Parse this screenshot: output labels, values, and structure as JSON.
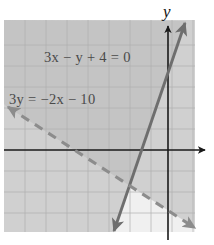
{
  "figure": {
    "kind": "coordinate-plane-inequality-graph",
    "plot_area": {
      "x": 4,
      "y": 20,
      "width": 191,
      "height": 212
    },
    "grid": {
      "spacing_px": 21,
      "color": "#b4b4b4",
      "visible": true
    },
    "background_color": "#f0f0f0",
    "axes": {
      "x_axis": {
        "y_px": 150,
        "arrow": "right",
        "color": "#1a1a1a"
      },
      "y_axis": {
        "x_px": 168,
        "arrow": "up",
        "color": "#1a1a1a"
      },
      "y_axis_label": "y",
      "x_axis_label": ""
    },
    "origin": {
      "x_px": 168,
      "y_px": 150
    },
    "shading": {
      "region_a_color": "#d4d4d4",
      "region_b_color": "#d4d4d4",
      "overlap_color": "#a9a9a9",
      "outside_color": "#f0f0f0"
    },
    "lines": [
      {
        "name": "line-solid",
        "label": "3x − y + 4 = 0",
        "style": "solid",
        "color": "#6e6e6e",
        "arrows": "both",
        "endpoints": {
          "x1": 113,
          "y1": 233,
          "x2": 186,
          "y2": 21
        },
        "label_position": {
          "x": 44,
          "y": 62
        }
      },
      {
        "name": "line-dashed",
        "label": "3y = −2x − 10",
        "style": "dashed",
        "color": "#8c8c8c",
        "arrows": "both",
        "endpoints": {
          "x1": 6,
          "y1": 106,
          "x2": 197,
          "y2": 229
        },
        "label_position": {
          "x": 10,
          "y": 104
        }
      }
    ],
    "labels": [
      {
        "name": "equation-label-1",
        "text": "3x − y + 4 = 0"
      },
      {
        "name": "equation-label-2",
        "text": "3y = −2x − 10"
      },
      {
        "name": "y-axis-label",
        "text": "y"
      }
    ]
  }
}
